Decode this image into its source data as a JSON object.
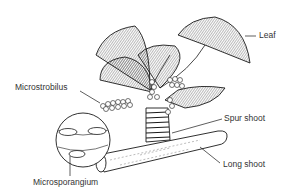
{
  "diagram": {
    "labels": {
      "leaf": "Leaf",
      "microstrobilus": "Microstrobilus",
      "spur_shoot": "Spur shoot",
      "long_shoot": "Long shoot",
      "microsporangium": "Microsporangium"
    },
    "colors": {
      "ink": "#1a1a1a",
      "label_text": "#333333",
      "background": "#ffffff"
    }
  }
}
